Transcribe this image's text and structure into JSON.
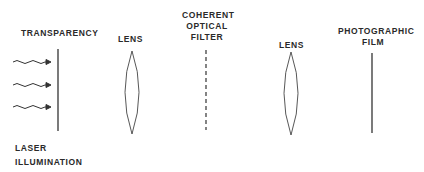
{
  "diagram": {
    "labels": {
      "transparency": "TRANSPARENCY",
      "lens1": "LENS",
      "filter_line1": "COHERENT",
      "filter_line2": "OPTICAL",
      "filter_line3": "FILTER",
      "lens2": "LENS",
      "film_line1": "PHOTOGRAPHIC",
      "film_line2": "FILM",
      "laser_line1": "LASER",
      "laser_line2": "ILLUMINATION"
    },
    "components": [
      {
        "name": "laser-illumination",
        "type": "wavy-arrows",
        "count": 3
      },
      {
        "name": "transparency",
        "type": "solid-line"
      },
      {
        "name": "lens-1",
        "type": "convex-lens"
      },
      {
        "name": "coherent-optical-filter",
        "type": "dashed-line"
      },
      {
        "name": "lens-2",
        "type": "convex-lens"
      },
      {
        "name": "photographic-film",
        "type": "solid-line"
      }
    ],
    "colors": {
      "stroke": "#333333",
      "text": "#2a2a2a",
      "background": "#ffffff"
    }
  }
}
